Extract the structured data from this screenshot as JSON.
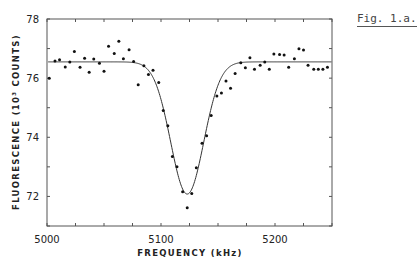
{
  "figure_label": "Fig. 1.a.",
  "chart_data": {
    "type": "scatter",
    "title": "",
    "xlabel": "FREQUENCY (kHz)",
    "ylabel": "FLUORESCENCE (10³ COUNTS)",
    "xlim": [
      5000,
      5250
    ],
    "ylim": [
      71,
      78
    ],
    "x_ticks_major": [
      5000,
      5100,
      5200
    ],
    "x_ticks_minor_step": 25,
    "y_ticks_major": [
      72,
      74,
      76,
      78
    ],
    "y_ticks_minor_step": 1,
    "grid": false,
    "legend": null,
    "series": [
      {
        "name": "measured",
        "style": "points",
        "x": [
          5002,
          5007,
          5011,
          5016,
          5020,
          5024,
          5029,
          5033,
          5037,
          5041,
          5046,
          5050,
          5054,
          5059,
          5063,
          5067,
          5072,
          5076,
          5080,
          5085,
          5089,
          5093,
          5098,
          5102,
          5106,
          5110,
          5114,
          5119,
          5123,
          5127,
          5131,
          5136,
          5140,
          5144,
          5149,
          5153,
          5157,
          5161,
          5165,
          5170,
          5174,
          5178,
          5182,
          5187,
          5191,
          5195,
          5199,
          5204,
          5208,
          5212,
          5217,
          5221,
          5225,
          5229,
          5234,
          5238,
          5242,
          5246
        ],
        "y": [
          76.0,
          76.58,
          76.62,
          76.38,
          76.55,
          76.9,
          76.37,
          76.67,
          76.2,
          76.65,
          76.5,
          76.23,
          77.08,
          76.83,
          77.25,
          76.66,
          76.96,
          76.56,
          75.78,
          76.42,
          76.12,
          76.27,
          75.85,
          74.91,
          74.39,
          73.35,
          73.0,
          72.16,
          71.62,
          72.1,
          72.97,
          73.8,
          74.05,
          74.74,
          75.4,
          75.5,
          75.9,
          75.66,
          76.16,
          76.52,
          76.35,
          76.69,
          76.3,
          76.44,
          76.55,
          76.3,
          76.82,
          76.8,
          76.78,
          76.37,
          76.66,
          76.99,
          76.95,
          76.44,
          76.3,
          76.3,
          76.3,
          76.37
        ]
      },
      {
        "name": "fit",
        "style": "line",
        "model": "gaussian",
        "baseline": 76.55,
        "depth": 4.47,
        "center": 5123,
        "sigma": 14.5
      }
    ]
  }
}
